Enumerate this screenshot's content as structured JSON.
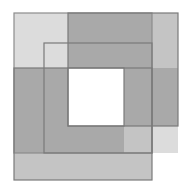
{
  "figure": {
    "title": "Three overlapping squares forming a nested spiral band pattern",
    "caption": "",
    "canvas": {
      "width": 192,
      "height": 193,
      "background": "#ffffff"
    },
    "palette": {
      "background": "#ffffff",
      "fill_light": "#dcdcdc",
      "fill_medium": "#c4c4c4",
      "fill_dark": "#a9a9a9",
      "fill_darkest": "#9a9a9a",
      "inner_white": "#ffffff",
      "stroke": "#7a7a7a",
      "stroke_soft": "#8c8c8c"
    },
    "stroke_width": 1.2,
    "shapes": [
      {
        "name": "square-back-left",
        "label": "Back left light square",
        "x": 14,
        "y": 13,
        "width": 138,
        "height": 140,
        "fill": "#dcdcdc",
        "stroke": "#8c8c8c"
      },
      {
        "name": "square-back-right",
        "label": "Back right medium square",
        "x": 68,
        "y": 13,
        "width": 110,
        "height": 113,
        "fill": "#c4c4c4",
        "stroke": "#7a7a7a"
      },
      {
        "name": "square-front-low",
        "label": "Front lower medium square",
        "x": 14,
        "y": 68,
        "width": 138,
        "height": 112,
        "fill": "#c4c4c4",
        "stroke": "#7a7a7a"
      },
      {
        "name": "square-front-right-low",
        "label": "Front lower right square",
        "x": 124,
        "y": 68,
        "width": 54,
        "height": 58,
        "fill": "#a9a9a9",
        "stroke": "#7a7a7a"
      },
      {
        "name": "square-middle-outline",
        "label": "Middle outlined square",
        "x": 44,
        "y": 43,
        "width": 108,
        "height": 110,
        "fill": "none",
        "stroke": "#7a7a7a"
      },
      {
        "name": "square-inner-white",
        "label": "Inner white square",
        "x": 68,
        "y": 68,
        "width": 56,
        "height": 58,
        "fill": "#ffffff",
        "stroke": "#7a7a7a"
      }
    ],
    "regions": [
      {
        "name": "region-top-left-light",
        "tone": "light",
        "fill": "#dcdcdc"
      },
      {
        "name": "region-top-right-medium",
        "tone": "medium",
        "fill": "#c4c4c4"
      },
      {
        "name": "region-top-overlap-dark",
        "tone": "dark",
        "fill": "#a9a9a9"
      },
      {
        "name": "region-left-band-medium",
        "tone": "medium",
        "fill": "#c4c4c4"
      },
      {
        "name": "region-left-overlap-dark",
        "tone": "dark",
        "fill": "#a9a9a9"
      },
      {
        "name": "region-bottom-band-medium",
        "tone": "medium",
        "fill": "#c4c4c4"
      },
      {
        "name": "region-bottom-right-light",
        "tone": "light",
        "fill": "#dcdcdc"
      },
      {
        "name": "region-right-lower-dark",
        "tone": "dark",
        "fill": "#a9a9a9"
      },
      {
        "name": "region-center-white",
        "tone": "white",
        "fill": "#ffffff"
      }
    ]
  }
}
